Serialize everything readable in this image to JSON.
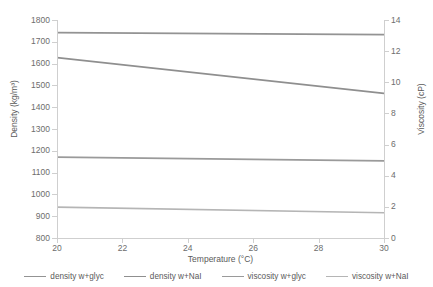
{
  "chart_data": {
    "type": "line",
    "title": "",
    "xlabel": "Temperature (°C)",
    "ylabel": "Density (kg/m³)",
    "y2label": "Viscosity (cP)",
    "xlim": [
      20,
      30
    ],
    "ylim": [
      800,
      1800
    ],
    "y2lim": [
      0,
      14
    ],
    "xticks": [
      20,
      22,
      24,
      26,
      28,
      30
    ],
    "yticks": [
      800,
      900,
      1000,
      1100,
      1200,
      1300,
      1400,
      1500,
      1600,
      1700,
      1800
    ],
    "y2ticks": [
      0,
      2,
      4,
      6,
      8,
      10,
      12,
      14
    ],
    "grid": false,
    "legend_position": "bottom",
    "series": [
      {
        "name": "density w+glyc",
        "axis": "left",
        "color": "#939393",
        "x": [
          20,
          30
        ],
        "values": [
          1742,
          1733
        ]
      },
      {
        "name": "density w+NaI",
        "axis": "left",
        "color": "#8f8f8f",
        "x": [
          20,
          30
        ],
        "values": [
          1627,
          1463
        ]
      },
      {
        "name": "viscosity w+glyc",
        "axis": "right",
        "color": "#9a9a9a",
        "x": [
          20,
          30
        ],
        "values": [
          5.2,
          4.95
        ]
      },
      {
        "name": "viscosity w+NaI",
        "axis": "right",
        "color": "#b5b5b5",
        "x": [
          20,
          30
        ],
        "values": [
          1.98,
          1.62
        ]
      }
    ]
  },
  "axis_colors": {
    "axis_line": "#cfcfcf",
    "tick_mark": "#cfcfcf",
    "text": "#5a5a5a"
  }
}
